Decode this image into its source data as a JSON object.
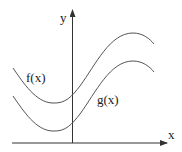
{
  "diagram": {
    "axes": {
      "x_label": "x",
      "y_label": "y",
      "color": "#333333"
    },
    "curves": [
      {
        "name": "f",
        "label": "f(x)",
        "color": "#555555"
      },
      {
        "name": "g",
        "label": "g(x)",
        "color": "#555555"
      }
    ]
  }
}
